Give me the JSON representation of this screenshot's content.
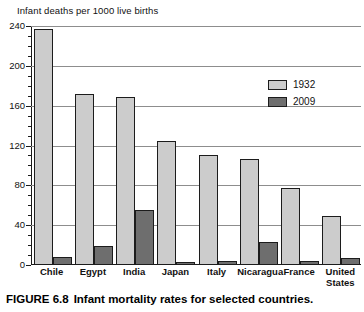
{
  "axis_title": "Infant deaths per 1000 live births",
  "caption": {
    "figure_number": "FIGURE 6.8",
    "text": "Infant mortality rates for selected countries."
  },
  "legend": {
    "position": "top-right",
    "entries": [
      {
        "label": "1932",
        "color": "#cccccc"
      },
      {
        "label": "2009",
        "color": "#6e6e6e"
      }
    ]
  },
  "colors": {
    "series_1932": "#cccccc",
    "series_2009": "#6e6e6e",
    "axis": "#1a1a1a",
    "gridline": "#8d8d8d",
    "background": "#ffffff"
  },
  "y_axis": {
    "ticks": [
      0,
      40,
      80,
      120,
      160,
      200,
      240
    ],
    "minor_tick_step": 10,
    "min": 0,
    "max": 240
  },
  "chart_data": {
    "type": "bar",
    "title": "Infant mortality rates for selected countries.",
    "xlabel": "",
    "ylabel": "Infant deaths per 1000 live births",
    "ylim": [
      0,
      240
    ],
    "yticks": [
      0,
      40,
      80,
      120,
      160,
      200,
      240
    ],
    "grid": true,
    "legend_position": "top-right",
    "categories": [
      "Chile",
      "Egypt",
      "India",
      "Japan",
      "Italy",
      "Nicaragua",
      "France",
      "United States"
    ],
    "series": [
      {
        "name": "1932",
        "color": "#cccccc",
        "values": [
          237,
          172,
          169,
          125,
          110,
          106,
          77,
          49
        ]
      },
      {
        "name": "2009",
        "color": "#6e6e6e",
        "values": [
          8,
          19,
          55,
          3,
          4,
          23,
          4,
          7
        ]
      }
    ]
  }
}
